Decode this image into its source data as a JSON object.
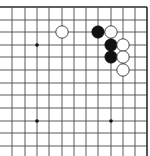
{
  "board": {
    "description": "Go board fragment showing the top-right corner",
    "visible_columns_x": [
      12,
      25,
      37,
      49,
      62,
      74,
      86,
      98,
      111,
      123,
      135,
      147
    ],
    "visible_rows_y": [
      7,
      20,
      32,
      45,
      57,
      70,
      83,
      95,
      108,
      121,
      133,
      146
    ],
    "top_edge": true,
    "right_edge": true,
    "line_color": "#4a4a4a",
    "edge_color": "#2a2a2a",
    "background": "#ffffff",
    "star_points": [
      {
        "col": 2,
        "row": 3
      },
      {
        "col": 2,
        "row": 9
      },
      {
        "col": 8,
        "row": 9
      }
    ],
    "stones": [
      {
        "color": "white",
        "col": 4,
        "row": 2
      },
      {
        "color": "black",
        "col": 7,
        "row": 2
      },
      {
        "color": "white",
        "col": 8,
        "row": 2
      },
      {
        "color": "black",
        "col": 8,
        "row": 3
      },
      {
        "color": "white",
        "col": 9,
        "row": 3
      },
      {
        "color": "black",
        "col": 8,
        "row": 4
      },
      {
        "color": "white",
        "col": 9,
        "row": 4
      },
      {
        "color": "white",
        "col": 9,
        "row": 5
      }
    ]
  }
}
